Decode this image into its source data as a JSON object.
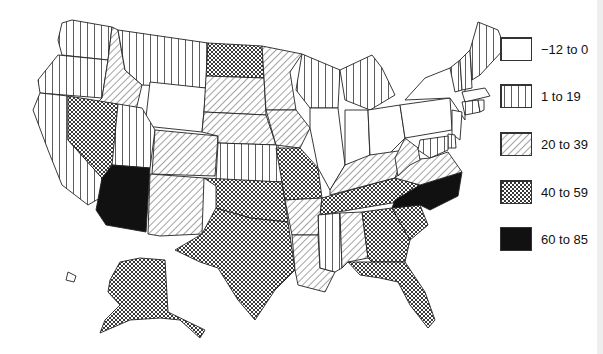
{
  "map": {
    "type": "choropleth",
    "region": "United States",
    "legend": [
      {
        "id": "c0",
        "label": "−12  to 0",
        "min": -12,
        "max": 0,
        "pattern": "blank"
      },
      {
        "id": "c1",
        "label": "1 to 19",
        "min": 1,
        "max": 19,
        "pattern": "vertical-lines"
      },
      {
        "id": "c2",
        "label": "20 to 39",
        "min": 20,
        "max": 39,
        "pattern": "diagonal-lines"
      },
      {
        "id": "c3",
        "label": "40 to 59",
        "min": 40,
        "max": 59,
        "pattern": "crosshatch"
      },
      {
        "id": "c4",
        "label": "60 to 85",
        "min": 60,
        "max": 85,
        "pattern": "solid-black"
      }
    ],
    "states": {
      "WA": "c1",
      "OR": "c1",
      "CA": "c1",
      "ID": "c2",
      "MT": "c1",
      "WY": "c0",
      "NV": "c3",
      "UT": "c1",
      "AZ": "c4",
      "CO": "c2",
      "NM": "c2",
      "ND": "c3",
      "SD": "c2",
      "NE": "c2",
      "KS": "c1",
      "OK": "c3",
      "TX": "c3",
      "MN": "c2",
      "IA": "c2",
      "MO": "c3",
      "AR": "c2",
      "LA": "c2",
      "WI": "c1",
      "IL": "c0",
      "MI": "c1",
      "IN": "c0",
      "OH": "c0",
      "KY": "c2",
      "TN": "c3",
      "MS": "c1",
      "AL": "c2",
      "GA": "c3",
      "FL": "c3",
      "SC": "c3",
      "NC": "c4",
      "VA": "c2",
      "WV": "c2",
      "PA": "c0",
      "NY": "c0",
      "VT": "c1",
      "NH": "c1",
      "ME": "c1",
      "MA": "c0",
      "CT": "c1",
      "RI": "c0",
      "NJ": "c0",
      "DE": "c1",
      "MD": "c1",
      "AK": "c3",
      "HI": "c0"
    }
  }
}
